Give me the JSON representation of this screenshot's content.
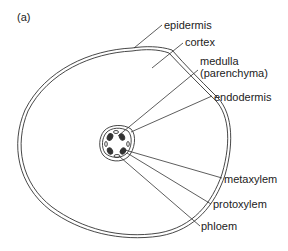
{
  "figure": {
    "panel_label": "(a)",
    "labels": {
      "epidermis": "epidermis",
      "cortex": "cortex",
      "medulla_line1": "medulla",
      "medulla_line2": "(parenchyma)",
      "endodermis": "endodermis",
      "metaxylem": "metaxylem",
      "protoxylem": "protoxylem",
      "phloem": "phloem"
    },
    "colors": {
      "line": "#333333",
      "text": "#222222",
      "background": "#ffffff"
    }
  }
}
